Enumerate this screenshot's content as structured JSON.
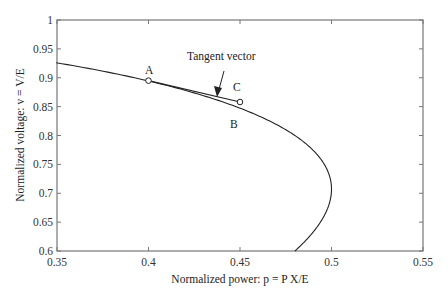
{
  "chart_data": {
    "type": "line",
    "title": "",
    "xlabel": "Normalized power: p = P X/E",
    "ylabel": "Normalized voltage: v = V/E",
    "xlim": [
      0.35,
      0.55
    ],
    "ylim": [
      0.6,
      1.0
    ],
    "xticks": [
      "0.35",
      "0.4",
      "0.45",
      "0.5",
      "0.55"
    ],
    "yticks": [
      "0.6",
      "0.65",
      "0.7",
      "0.75",
      "0.8",
      "0.85",
      "0.9",
      "0.95",
      "1"
    ],
    "grid": false,
    "series": [
      {
        "name": "PV curve",
        "x": [
          0.351,
          0.378,
          0.4,
          0.42,
          0.44,
          0.46,
          0.48,
          0.492,
          0.5,
          0.497,
          0.49,
          0.48
        ],
        "y": [
          0.925,
          0.912,
          0.895,
          0.878,
          0.856,
          0.829,
          0.793,
          0.762,
          0.707,
          0.67,
          0.64,
          0.6
        ]
      },
      {
        "name": "Tangent vector",
        "x": [
          0.4,
          0.45
        ],
        "y": [
          0.895,
          0.858
        ]
      }
    ],
    "annotations": [
      {
        "text": "A",
        "x": 0.4,
        "y": 0.895
      },
      {
        "text": "B",
        "x": 0.45,
        "y": 0.85
      },
      {
        "text": "C",
        "x": 0.45,
        "y": 0.858
      },
      {
        "text": "Tangent vector",
        "x": 0.44,
        "y": 0.87
      }
    ]
  },
  "labels": {
    "xlabel": "Normalized power: p = P X/E",
    "ylabel": "Normalized voltage: v = V/E",
    "tangent": "Tangent vector",
    "A": "A",
    "B": "B",
    "C": "C"
  }
}
